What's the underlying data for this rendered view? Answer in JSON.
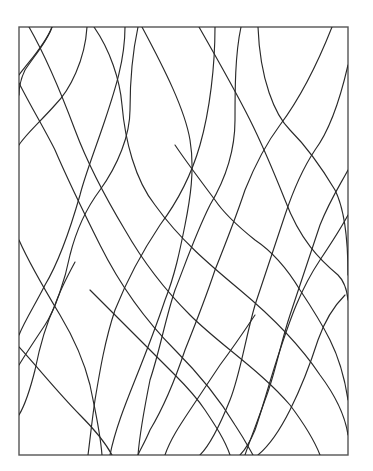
{
  "artwork": {
    "type": "abstract-line-art",
    "background": "#ffffff",
    "stroke_color": "#2a2a2a",
    "frame_color": "#555555",
    "frame": {
      "x": 19,
      "y": 27,
      "width": 329,
      "height": 428
    },
    "curves": [
      {
        "id": "c1",
        "d": "M29,27 C45,55 60,90 75,130 C90,170 110,205 125,230 C145,265 165,290 190,315 C220,345 260,370 290,405 C305,425 315,442 320,455"
      },
      {
        "id": "c2",
        "d": "M52,27 C45,45 30,60 19,75 "
      },
      {
        "id": "c3",
        "d": "M52,27 C48,40 35,55 25,70 C20,80 19,90 19,95"
      },
      {
        "id": "c4",
        "d": "M87,27 C85,60 70,90 55,105 C40,122 25,135 19,145"
      },
      {
        "id": "c5",
        "d": "M94,27 C110,50 120,80 122,105 C125,140 135,180 155,205 C180,240 210,265 240,290 C270,315 300,345 320,375 C335,395 345,415 348,435"
      },
      {
        "id": "c6",
        "d": "M125,27 C125,60 115,90 105,120 C95,150 85,175 80,195 C70,230 60,260 45,285 C35,305 25,320 19,335"
      },
      {
        "id": "c7",
        "d": "M138,27 C133,50 130,80 130,110 C130,135 118,165 100,190 C85,210 75,235 70,255 C65,280 55,310 45,325 C35,340 25,355 19,365"
      },
      {
        "id": "c8",
        "d": "M142,27 C165,70 185,110 190,140 C195,170 190,200 185,225 C180,250 175,275 165,300 C155,330 145,355 135,380 C125,405 115,430 110,455"
      },
      {
        "id": "c9",
        "d": "M199,27 C215,55 235,90 250,120 C265,150 275,175 285,200 C300,240 320,260 338,275 C343,280 347,290 348,300"
      },
      {
        "id": "c10",
        "d": "M215,27 C215,65 210,110 200,145 C190,180 175,205 160,225 C140,255 125,285 115,310 C105,340 100,370 95,400 C92,420 90,440 88,455"
      },
      {
        "id": "c11",
        "d": "M241,27 C235,55 235,90 235,120 C235,150 225,180 210,205 C195,235 185,265 175,290 C165,320 160,350 150,380 C145,405 140,430 138,455"
      },
      {
        "id": "c12",
        "d": "M258,27 C260,80 275,115 290,130 C305,145 320,165 335,190 C345,210 348,240 348,275"
      },
      {
        "id": "c13",
        "d": "M332,27 C315,70 295,105 280,125 C265,145 255,165 245,190 C235,220 225,245 215,270 C205,300 195,325 185,350 C175,380 162,410 150,430 C145,442 140,450 138,455"
      },
      {
        "id": "c14",
        "d": "M348,65 C340,100 330,130 315,150 C305,165 295,185 285,215 C275,245 265,275 255,305 C245,340 240,375 230,400 C220,425 210,445 200,455"
      },
      {
        "id": "c15",
        "d": "M19,83 C30,105 45,130 55,150 C70,185 85,215 100,245 C120,285 145,320 175,350 C200,375 220,400 235,425 C245,440 250,450 253,455"
      },
      {
        "id": "c16",
        "d": "M348,170 C340,185 330,200 320,225 C310,255 300,285 290,315 C280,345 275,375 265,400 C258,420 250,440 245,455"
      },
      {
        "id": "c17",
        "d": "M19,240 C30,265 45,290 60,315 C75,340 85,365 90,385 C95,410 100,430 102,455"
      },
      {
        "id": "c18",
        "d": "M348,215 C340,230 330,245 320,260 C300,290 290,320 280,350 C270,380 262,410 255,430 C250,442 245,450 240,455"
      },
      {
        "id": "c19",
        "d": "M19,347 C40,370 60,395 80,415 C95,430 105,442 112,455"
      },
      {
        "id": "c20",
        "d": "M19,415 C25,405 30,390 35,370 C40,345 48,320 55,305 C60,290 68,275 75,262"
      },
      {
        "id": "c21",
        "d": "M348,400 C345,380 340,360 330,340 C320,320 310,305 300,290 C285,265 270,250 255,240 C240,228 225,215 215,200 C200,180 185,160 175,145"
      },
      {
        "id": "c22",
        "d": "M258,455 C270,445 280,430 290,410 C300,390 310,365 318,340 C325,320 335,305 345,295"
      },
      {
        "id": "c23",
        "d": "M230,455 C225,440 215,425 205,410 C195,395 185,385 175,375 C160,360 145,345 130,330 C115,315 100,300 90,290"
      },
      {
        "id": "c24",
        "d": "M165,455 C170,440 180,425 190,410 C200,395 210,380 220,365 C235,345 245,330 255,315"
      }
    ]
  }
}
